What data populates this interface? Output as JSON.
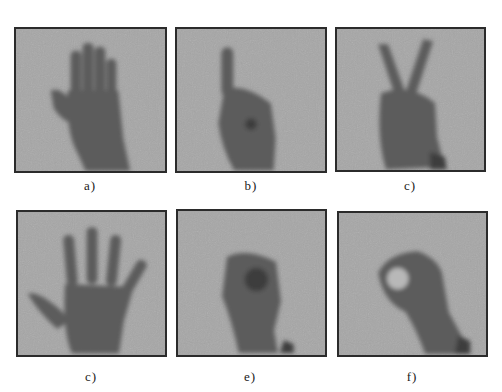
{
  "figure": {
    "panels": [
      {
        "id": "a",
        "label": "a)",
        "gesture": "open palm, fingers together",
        "x": 14,
        "y": 27,
        "w": 153,
        "h": 146
      },
      {
        "id": "b",
        "label": "b)",
        "gesture": "index finger raised (one)",
        "x": 175,
        "y": 27,
        "w": 152,
        "h": 146
      },
      {
        "id": "c",
        "label": "c)",
        "gesture": "V sign (two fingers)",
        "x": 335,
        "y": 27,
        "w": 151,
        "h": 145
      },
      {
        "id": "d",
        "label": "c)",
        "gesture": "open hand, fingers spread (five)",
        "x": 16,
        "y": 210,
        "w": 151,
        "h": 147
      },
      {
        "id": "e",
        "label": "e)",
        "gesture": "closed fist",
        "x": 176,
        "y": 209,
        "w": 151,
        "h": 148
      },
      {
        "id": "f",
        "label": "f)",
        "gesture": "OK sign (thumb and index circle)",
        "x": 337,
        "y": 211,
        "w": 151,
        "h": 146
      }
    ],
    "colors": {
      "background": "#ffffff",
      "panel_bg": "#a6a6a6",
      "hand": "#5c5c5c",
      "hand_dark": "#3e3e3e",
      "border": "#2b2b2b",
      "label": "#1a1a1a"
    }
  }
}
